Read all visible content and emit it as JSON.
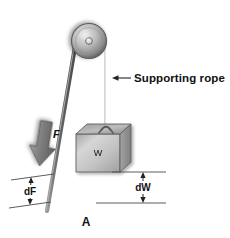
{
  "figure": {
    "panel_label": "A",
    "title_alt": "Pulley system diagram",
    "background_color": "#ffffff"
  },
  "labels": {
    "supporting_rope": "Supporting rope",
    "force_arrow": "F",
    "weight_block": "W",
    "distance_force": "dF",
    "distance_weight": "dW"
  },
  "colors": {
    "rope": "#6e6e6e",
    "rope_dark": "#4a4a4a",
    "pulley_light": "#d8d8d8",
    "pulley_mid": "#9a9a9a",
    "pulley_dark": "#5a5a5a",
    "block_front": "#c8c8c8",
    "block_top": "#b0b0b0",
    "block_side": "#9a9a9a",
    "arrow_fill": "#808080",
    "line": "#4a4a4a",
    "text": "#111111"
  },
  "geometry": {
    "pulley_center_x": 89,
    "pulley_center_y": 41,
    "pulley_radius": 17,
    "hub_radius": 3,
    "rope_left_top_x": 75,
    "rope_left_top_y": 46,
    "rope_left_bottom_x": 47,
    "rope_left_bottom_y": 211,
    "rope_right_x": 106,
    "rope_right_top_y": 47,
    "rope_right_bottom_y": 124,
    "block_left": 76,
    "block_right": 131,
    "block_top": 127,
    "block_bottom": 172,
    "dim_w_top_y": 172,
    "dim_w_bottom_y": 203,
    "dim_f_top_y": 176,
    "dim_f_bottom_y": 203
  }
}
